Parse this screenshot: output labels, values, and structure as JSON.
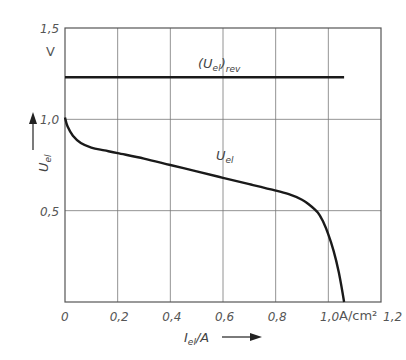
{
  "chart_data": {
    "type": "line",
    "title": "",
    "xlabel": "I_el/A",
    "xlabel_main": "I",
    "xlabel_sub": "el",
    "xlabel_tail": "/A",
    "x_unit": "A/cm²",
    "ylabel": "U_el",
    "ylabel_main": "U",
    "ylabel_sub": "el",
    "y_unit": "V",
    "xlim": [
      0,
      1.2
    ],
    "ylim": [
      0,
      1.5
    ],
    "grid": true,
    "x_ticks": [
      "0",
      "0,2",
      "0,4",
      "0,6",
      "0,8",
      "1,0",
      "1,2"
    ],
    "x_tick_values": [
      0,
      0.2,
      0.4,
      0.6,
      0.8,
      1.0,
      1.2
    ],
    "y_ticks": [
      "0,5",
      "1,0",
      "1,5"
    ],
    "y_tick_values": [
      0.5,
      1.0,
      1.5
    ],
    "series": [
      {
        "name": "(U_el)_rev",
        "label_main": "(U",
        "label_sub": "el",
        "label_tail": ")",
        "label_sub2": "rev",
        "x": [
          0,
          1.06
        ],
        "y": [
          1.23,
          1.23
        ]
      },
      {
        "name": "U_el",
        "label_main": "U",
        "label_sub": "el",
        "x": [
          0.0,
          0.01,
          0.03,
          0.06,
          0.1,
          0.15,
          0.2,
          0.3,
          0.4,
          0.5,
          0.6,
          0.7,
          0.8,
          0.85,
          0.9,
          0.93,
          0.96,
          0.98,
          1.0,
          1.02,
          1.04,
          1.06
        ],
        "y": [
          1.01,
          0.96,
          0.91,
          0.87,
          0.845,
          0.83,
          0.815,
          0.785,
          0.75,
          0.715,
          0.68,
          0.645,
          0.61,
          0.59,
          0.56,
          0.53,
          0.49,
          0.44,
          0.37,
          0.28,
          0.16,
          0.0
        ]
      }
    ]
  }
}
